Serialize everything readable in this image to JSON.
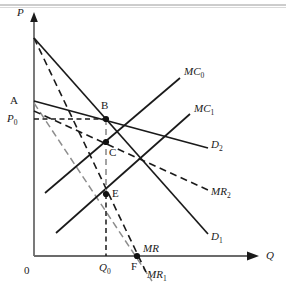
{
  "figure": {
    "type": "economics-line-diagram",
    "background": "#ffffff",
    "width": 286,
    "height": 294,
    "stroke_color": "#1a1a1a",
    "axis_color": "#6b6b6b",
    "dash_color": "#4a4a4a",
    "top_rule_color": "#9a9a9a"
  },
  "axes": {
    "origin_label": "0",
    "y_axis_label": "P",
    "x_axis_label": "Q",
    "origin": {
      "x": 34,
      "y": 256
    },
    "y_top": {
      "x": 34,
      "y": 14
    },
    "x_right": {
      "x": 258,
      "y": 256
    }
  },
  "price_marks": {
    "p0_label": "P",
    "p0_sub": "0",
    "q0_label": "Q",
    "q0_sub": "0",
    "a_label": "A",
    "p0_y": 119,
    "q0_x": 106
  },
  "points": [
    {
      "name": "B",
      "label": "B",
      "x": 106,
      "y": 119,
      "label_x": 101,
      "label_y": 105
    },
    {
      "name": "C",
      "label": "C",
      "x": 106,
      "y": 142,
      "label_x": 109,
      "label_y": 152
    },
    {
      "name": "E",
      "label": "E",
      "x": 106,
      "y": 194,
      "label_x": 112,
      "label_y": 192
    },
    {
      "name": "F",
      "label": "F",
      "x": 137,
      "y": 256,
      "label_x": 132,
      "label_y": 266
    }
  ],
  "curves": [
    {
      "name": "D1",
      "label": "D",
      "sub": "1",
      "style": "solid",
      "from": {
        "x": 34,
        "y": 38
      },
      "to": {
        "x": 208,
        "y": 234
      },
      "label_x": 211,
      "label_y": 237
    },
    {
      "name": "MR1",
      "label": "MR",
      "sub": "1",
      "style": "dashed",
      "from": {
        "x": 34,
        "y": 38
      },
      "to": {
        "x": 146,
        "y": 272
      },
      "label_x": 148,
      "label_y": 275
    },
    {
      "name": "D2",
      "label": "D",
      "sub": "2",
      "style": "solid",
      "from": {
        "x": 34,
        "y": 101
      },
      "to": {
        "x": 208,
        "y": 148
      },
      "label_x": 211,
      "label_y": 145
    },
    {
      "name": "MR2",
      "label": "MR",
      "sub": "2",
      "style": "dashed",
      "from": {
        "x": 34,
        "y": 111
      },
      "to": {
        "x": 208,
        "y": 190
      },
      "label_x": 211,
      "label_y": 193
    },
    {
      "name": "MC0",
      "label": "MC",
      "sub": "0",
      "style": "solid",
      "from": {
        "x": 45,
        "y": 193
      },
      "to": {
        "x": 180,
        "y": 78
      },
      "label_x": 185,
      "label_y": 73
    },
    {
      "name": "MC1",
      "label": "MC",
      "sub": "1",
      "style": "solid",
      "from": {
        "x": 56,
        "y": 233
      },
      "to": {
        "x": 190,
        "y": 114
      },
      "label_x": 195,
      "label_y": 110
    },
    {
      "name": "MR",
      "label": "MR",
      "sub": "",
      "style": "dashed-grey",
      "from": {
        "x": 34,
        "y": 103
      },
      "to": {
        "x": 152,
        "y": 281
      },
      "label_x": 146,
      "label_y": 250
    }
  ],
  "guides": {
    "p0_horizontal": {
      "from_x": 34,
      "to_x": 106,
      "y": 119
    },
    "q0_vertical": {
      "x": 106,
      "from_y": 119,
      "to_y": 256
    }
  }
}
